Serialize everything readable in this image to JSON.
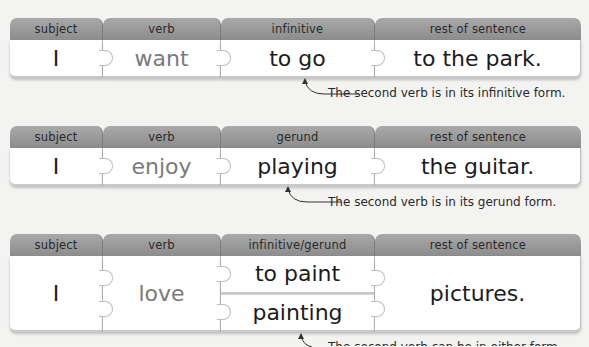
{
  "colors": {
    "background": "#f3f3f2",
    "header_bg": "#9a9a9a",
    "tile_bg": "#ffffff",
    "text_dark": "#1c1c1c",
    "text_grey": "#7a7a7a"
  },
  "rows": [
    {
      "headers": [
        "subject",
        "verb",
        "infinitive",
        "rest of sentence"
      ],
      "cells": [
        "I",
        "want",
        "to go",
        "to the park."
      ],
      "annotation": "The second verb is in its infinitive form."
    },
    {
      "headers": [
        "subject",
        "verb",
        "gerund",
        "rest of sentence"
      ],
      "cells": [
        "I",
        "enjoy",
        "playing",
        "the guitar."
      ],
      "annotation": "The second verb is in its gerund form."
    },
    {
      "headers": [
        "subject",
        "verb",
        "infinitive/gerund",
        "rest of sentence"
      ],
      "cells": [
        "I",
        "love",
        [
          "to paint",
          "painting"
        ],
        "pictures."
      ],
      "stack": [
        "to paint",
        "painting"
      ],
      "annotation_partial": "The second verb can be in either form."
    }
  ]
}
